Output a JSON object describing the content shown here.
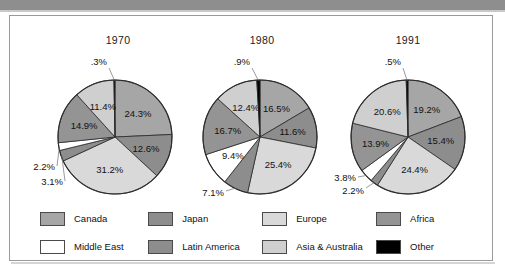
{
  "figure": {
    "background_color": "#ffffff",
    "border_color": "#9a9a9a",
    "top_bar_color": "#8e8e8e"
  },
  "legend": {
    "items": [
      {
        "label": "Canada",
        "color": "#a6a6a6"
      },
      {
        "label": "Japan",
        "color": "#8d8d8d"
      },
      {
        "label": "Europe",
        "color": "#d9d9d9"
      },
      {
        "label": "Africa",
        "color": "#949494"
      },
      {
        "label": "Middle East",
        "color": "#ffffff"
      },
      {
        "label": "Latin America",
        "color": "#8d8d8d"
      },
      {
        "label": "Asia &\nAustralia",
        "color": "#cfcfcf"
      },
      {
        "label": "Other",
        "color": "#000000"
      }
    ],
    "row1": [
      {
        "label": "Canada",
        "color": "#a6a6a6"
      },
      {
        "label": "Japan",
        "color": "#8d8d8d"
      },
      {
        "label": "Europe",
        "color": "#d9d9d9"
      },
      {
        "label": "Africa",
        "color": "#949494"
      }
    ],
    "row2": [
      {
        "label": "Middle East",
        "color": "#ffffff"
      },
      {
        "label": "Latin America",
        "color": "#8d8d8d"
      },
      {
        "label": "Asia & Australia",
        "color": "#cfcfcf"
      },
      {
        "label": "Other",
        "color": "#000000"
      }
    ]
  },
  "chart_data": [
    {
      "type": "pie",
      "title": "1970",
      "categories": [
        "Canada",
        "Japan",
        "Europe",
        "Latin America",
        "Middle East",
        "Africa",
        "Asia & Australia",
        "Other"
      ],
      "values": [
        24.3,
        12.6,
        31.2,
        3.1,
        2.2,
        14.9,
        11.4,
        0.3
      ],
      "labels": [
        "24.3%",
        "12.6%",
        "31.2%",
        "3.1%",
        "2.2%",
        "14.9%",
        "11.4%",
        ".3%"
      ],
      "colors": [
        "#a6a6a6",
        "#8d8d8d",
        "#d9d9d9",
        "#8d8d8d",
        "#ffffff",
        "#949494",
        "#cfcfcf",
        "#000000"
      ],
      "label_placement": [
        "inside",
        "inside",
        "inside",
        "outside",
        "outside",
        "inside",
        "inside",
        "outside"
      ],
      "start_angle_deg": 0,
      "direction": "clockwise",
      "legend_position": "bottom"
    },
    {
      "type": "pie",
      "title": "1980",
      "categories": [
        "Canada",
        "Japan",
        "Europe",
        "Latin America",
        "Middle East",
        "Africa",
        "Asia & Australia",
        "Other"
      ],
      "values": [
        16.5,
        11.6,
        25.4,
        7.1,
        9.4,
        16.7,
        12.4,
        0.9
      ],
      "labels": [
        "16.5%",
        "11.6%",
        "25.4%",
        "7.1%",
        "9.4%",
        "16.7%",
        "12.4%",
        ".9%"
      ],
      "colors": [
        "#a6a6a6",
        "#8d8d8d",
        "#d9d9d9",
        "#8d8d8d",
        "#ffffff",
        "#949494",
        "#cfcfcf",
        "#000000"
      ],
      "label_placement": [
        "inside",
        "inside",
        "inside",
        "outside",
        "inside",
        "inside",
        "inside",
        "outside"
      ],
      "start_angle_deg": 0,
      "direction": "clockwise",
      "legend_position": "bottom"
    },
    {
      "type": "pie",
      "title": "1991",
      "categories": [
        "Canada",
        "Japan",
        "Europe",
        "Latin America",
        "Middle East",
        "Africa",
        "Asia & Australia",
        "Other"
      ],
      "values": [
        19.2,
        15.4,
        24.4,
        2.2,
        3.8,
        13.9,
        20.6,
        0.5
      ],
      "labels": [
        "19.2%",
        "15.4%",
        "24.4%",
        "2.2%",
        "3.8%",
        "13.9%",
        "20.6%",
        ".5%"
      ],
      "colors": [
        "#a6a6a6",
        "#8d8d8d",
        "#d9d9d9",
        "#8d8d8d",
        "#ffffff",
        "#949494",
        "#cfcfcf",
        "#000000"
      ],
      "label_placement": [
        "inside",
        "inside",
        "inside",
        "outside",
        "outside",
        "inside",
        "inside",
        "outside"
      ],
      "start_angle_deg": 0,
      "direction": "clockwise",
      "legend_position": "bottom"
    }
  ]
}
